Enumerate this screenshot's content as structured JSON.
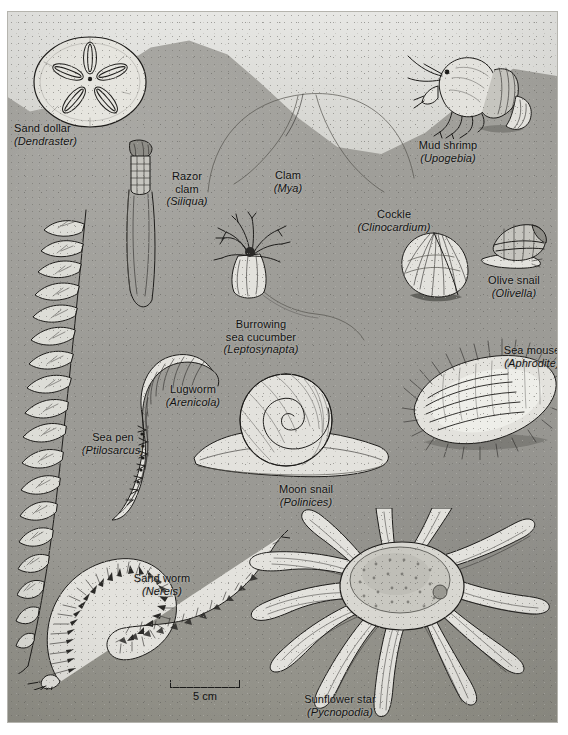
{
  "plate": {
    "title": "Sandy-bottom benthic community",
    "background_color": "#9d9c97",
    "water_color": "#e0e0dc",
    "ink_color": "#1d1c1a"
  },
  "scale_bar": {
    "label": "5 cm",
    "length_px": 70
  },
  "organisms": [
    {
      "common": "Sand dollar",
      "scientific": "(Dendraster)"
    },
    {
      "common": "Mud shrimp",
      "scientific": "(Upogebia)"
    },
    {
      "common": "Razor\nclam",
      "common_line1": "Razor",
      "common_line2": "clam",
      "scientific": "(Siliqua)"
    },
    {
      "common": "Clam",
      "scientific": "(Mya)"
    },
    {
      "common": "Cockle",
      "scientific": "(Clinocardium)"
    },
    {
      "common": "Olive snail",
      "scientific": "(Olivella)"
    },
    {
      "common": "Burrowing",
      "common_line2": "sea cucumber",
      "scientific": "(Leptosynapta)"
    },
    {
      "common": "Sea mouse",
      "scientific": "(Aphrodite)"
    },
    {
      "common": "Sea pen",
      "scientific": "(Ptilosarcus)"
    },
    {
      "common": "Lugworm",
      "scientific": "(Arenicola)"
    },
    {
      "common": "Moon snail",
      "scientific": "(Polinices)"
    },
    {
      "common": "Sand worm",
      "scientific": "(Nereis)"
    },
    {
      "common": "Sunflower star",
      "scientific": "(Pycnopodia)"
    }
  ],
  "labels": {
    "sand_dollar": {
      "line1": "Sand dollar",
      "line2": "(Dendraster)"
    },
    "mud_shrimp": {
      "line1": "Mud shrimp",
      "line2": "(Upogebia)"
    },
    "razor_clam": {
      "line1": "Razor",
      "line2": "clam",
      "line3": "(Siliqua)"
    },
    "clam": {
      "line1": "Clam",
      "line2": "(Mya)"
    },
    "cockle": {
      "line1": "Cockle",
      "line2": "(Clinocardium)"
    },
    "olive_snail": {
      "line1": "Olive snail",
      "line2": "(Olivella)"
    },
    "sea_cucumber": {
      "line1": "Burrowing",
      "line2": "sea cucumber",
      "line3": "(Leptosynapta)"
    },
    "sea_mouse": {
      "line1": "Sea mouse",
      "line2": "(Aphrodite)"
    },
    "sea_pen": {
      "line1": "Sea pen",
      "line2": "(Ptilosarcus)"
    },
    "lugworm": {
      "line1": "Lugworm",
      "line2": "(Arenicola)"
    },
    "moon_snail": {
      "line1": "Moon snail",
      "line2": "(Polinices)"
    },
    "sand_worm": {
      "line1": "Sand worm",
      "line2": "(Nereis)"
    },
    "sunflower_star": {
      "line1": "Sunflower star",
      "line2": "(Pycnopodia)"
    }
  }
}
